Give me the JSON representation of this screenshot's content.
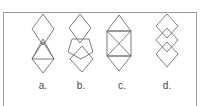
{
  "diagram": {
    "stroke_color": "#6e6e6e",
    "frame_color": "#9a9a9a",
    "options": [
      {
        "label": "a.",
        "description": "diamond above a triangle overlapping a lower diamond"
      },
      {
        "label": "b.",
        "description": "diamond above a pentagon overlapping a lower diamond"
      },
      {
        "label": "c.",
        "description": "square with diagonals and triangles on top and bottom"
      },
      {
        "label": "d.",
        "description": "three stacked overlapping diamonds"
      }
    ]
  }
}
